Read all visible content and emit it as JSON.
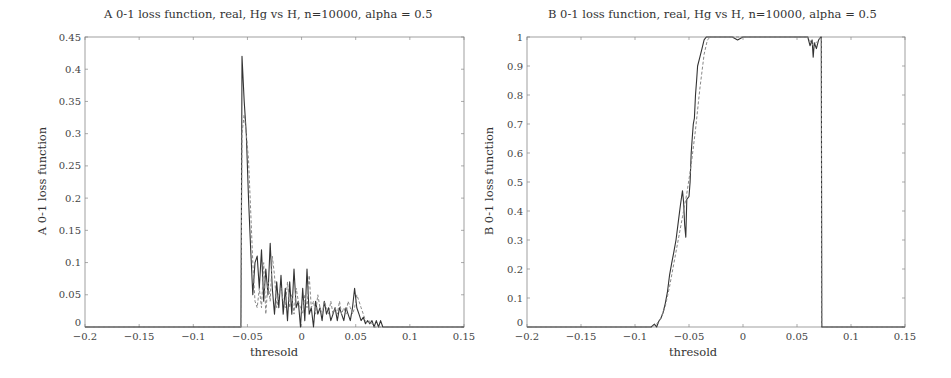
{
  "chart_data": [
    {
      "id": "A",
      "type": "line",
      "title": "A 0-1 loss function, real, Hg vs H, n=10000, alpha = 0.5",
      "xlabel": "thresold",
      "ylabel": "A 0-1 loss function",
      "xlim": [
        -0.2,
        0.15
      ],
      "ylim": [
        0,
        0.45
      ],
      "xticks": [
        "−0.2",
        "−0.15",
        "−0.1",
        "−0.05",
        "0",
        "0.05",
        "0.1",
        "0.15"
      ],
      "yticks": [
        "0",
        "0.05",
        "0.1",
        "0.15",
        "0.2",
        "0.25",
        "0.3",
        "0.35",
        "0.4",
        "0.45"
      ],
      "grid": false,
      "legend": null,
      "series": [
        {
          "name": "solid",
          "style": "solid",
          "x": [
            -0.2,
            -0.056,
            -0.0555,
            -0.055,
            -0.053,
            -0.051,
            -0.049,
            -0.047,
            -0.045,
            -0.043,
            -0.041,
            -0.039,
            -0.037,
            -0.035,
            -0.033,
            -0.031,
            -0.029,
            -0.027,
            -0.025,
            -0.023,
            -0.021,
            -0.019,
            -0.017,
            -0.015,
            -0.013,
            -0.011,
            -0.009,
            -0.007,
            -0.005,
            -0.003,
            -0.001,
            0.001,
            0.003,
            0.005,
            0.007,
            0.009,
            0.011,
            0.013,
            0.015,
            0.017,
            0.019,
            0.021,
            0.023,
            0.025,
            0.027,
            0.029,
            0.031,
            0.033,
            0.035,
            0.037,
            0.039,
            0.041,
            0.043,
            0.045,
            0.047,
            0.049,
            0.051,
            0.053,
            0.055,
            0.057,
            0.059,
            0.061,
            0.063,
            0.065,
            0.067,
            0.069,
            0.071,
            0.073,
            0.075,
            0.077,
            0.15
          ],
          "y": [
            0,
            0,
            0.2,
            0.42,
            0.35,
            0.3,
            0.2,
            0.12,
            0.05,
            0.1,
            0.11,
            0.06,
            0.12,
            0.04,
            0.09,
            0.05,
            0.13,
            0.06,
            0.02,
            0.07,
            0.03,
            0.08,
            0.02,
            0.06,
            0.01,
            0.07,
            0.02,
            0.09,
            0.03,
            0.04,
            0.0,
            0.06,
            0.01,
            0.09,
            0.02,
            0.03,
            0.0,
            0.04,
            0.02,
            0.03,
            0.01,
            0.04,
            0.02,
            0.03,
            0.01,
            0.02,
            0.03,
            0.01,
            0.03,
            0.02,
            0.01,
            0.03,
            0.02,
            0.01,
            0.03,
            0.06,
            0.03,
            0.02,
            0.01,
            0.015,
            0.005,
            0.01,
            0.005,
            0.01,
            0.0,
            0.01,
            0.0,
            0.01,
            0.0,
            0.0,
            0.0
          ]
        },
        {
          "name": "dashed",
          "style": "dashed",
          "x": [
            -0.2,
            -0.056,
            -0.055,
            -0.053,
            -0.051,
            -0.049,
            -0.047,
            -0.045,
            -0.043,
            -0.041,
            -0.039,
            -0.037,
            -0.035,
            -0.033,
            -0.031,
            -0.029,
            -0.027,
            -0.025,
            -0.023,
            -0.021,
            -0.019,
            -0.017,
            -0.015,
            -0.013,
            -0.011,
            -0.009,
            -0.007,
            -0.005,
            -0.003,
            -0.001,
            0.001,
            0.003,
            0.005,
            0.007,
            0.009,
            0.011,
            0.013,
            0.015,
            0.017,
            0.019,
            0.021,
            0.023,
            0.025,
            0.027,
            0.029,
            0.031,
            0.033,
            0.035,
            0.037,
            0.039,
            0.041,
            0.043,
            0.045,
            0.047,
            0.049,
            0.051,
            0.053,
            0.055,
            0.057,
            0.059,
            0.061,
            0.063,
            0.065,
            0.067,
            0.069,
            0.071,
            0.15
          ],
          "y": [
            0,
            0,
            0.3,
            0.33,
            0.3,
            0.26,
            0.18,
            0.1,
            0.04,
            0.03,
            0.06,
            0.03,
            0.1,
            0.02,
            0.07,
            0.04,
            0.11,
            0.08,
            0.03,
            0.05,
            0.06,
            0.04,
            0.03,
            0.07,
            0.03,
            0.05,
            0.02,
            0.06,
            0.04,
            0.03,
            0.02,
            0.05,
            0.03,
            0.08,
            0.03,
            0.04,
            0.02,
            0.05,
            0.03,
            0.02,
            0.04,
            0.03,
            0.02,
            0.04,
            0.02,
            0.03,
            0.02,
            0.04,
            0.02,
            0.03,
            0.02,
            0.04,
            0.03,
            0.02,
            0.03,
            0.05,
            0.04,
            0.03,
            0.02,
            0.01,
            0.005,
            0.01,
            0.005,
            0.0,
            0.0,
            0.0,
            0.0
          ]
        }
      ]
    },
    {
      "id": "B",
      "type": "line",
      "title": "B 0-1 loss function, real, Hg vs H, n=10000, alpha = 0.5",
      "xlabel": "thresold",
      "ylabel": "B 0-1 loss function",
      "xlim": [
        -0.2,
        0.15
      ],
      "ylim": [
        0,
        1
      ],
      "xticks": [
        "−0.2",
        "−0.15",
        "−0.1",
        "−0.05",
        "0",
        "0.05",
        "0.1",
        "0.15"
      ],
      "yticks": [
        "0",
        "0.1",
        "0.2",
        "0.3",
        "0.4",
        "0.5",
        "0.6",
        "0.7",
        "0.8",
        "0.9",
        "1"
      ],
      "grid": false,
      "legend": null,
      "series": [
        {
          "name": "solid",
          "style": "solid",
          "x": [
            -0.2,
            -0.085,
            -0.082,
            -0.08,
            -0.078,
            -0.076,
            -0.074,
            -0.072,
            -0.07,
            -0.068,
            -0.066,
            -0.064,
            -0.062,
            -0.06,
            -0.058,
            -0.056,
            -0.055,
            -0.054,
            -0.053,
            -0.052,
            -0.05,
            -0.049,
            -0.048,
            -0.047,
            -0.046,
            -0.045,
            -0.044,
            -0.043,
            -0.042,
            -0.04,
            -0.038,
            -0.036,
            -0.034,
            -0.03,
            -0.02,
            -0.01,
            -0.005,
            0.0,
            0.02,
            0.04,
            0.06,
            0.062,
            0.064,
            0.065,
            0.066,
            0.068,
            0.07,
            0.072,
            0.0725,
            0.073,
            0.08,
            0.15
          ],
          "y": [
            0,
            0,
            0.01,
            0.0,
            0.02,
            0.03,
            0.05,
            0.08,
            0.12,
            0.18,
            0.22,
            0.26,
            0.3,
            0.36,
            0.42,
            0.47,
            0.43,
            0.35,
            0.31,
            0.44,
            0.45,
            0.5,
            0.6,
            0.65,
            0.7,
            0.72,
            0.8,
            0.85,
            0.9,
            0.93,
            0.96,
            0.99,
            1.0,
            1.0,
            1.0,
            1.0,
            0.99,
            1.0,
            1.0,
            1.0,
            1.0,
            0.97,
            0.99,
            0.93,
            0.98,
            0.96,
            0.99,
            1.0,
            1.0,
            0.0,
            0.0,
            0.0
          ]
        },
        {
          "name": "dashed",
          "style": "dashed",
          "x": [
            -0.2,
            -0.085,
            -0.08,
            -0.076,
            -0.072,
            -0.068,
            -0.064,
            -0.06,
            -0.056,
            -0.052,
            -0.048,
            -0.044,
            -0.04,
            -0.036,
            -0.033,
            -0.03,
            0.0,
            0.04,
            0.06,
            0.065,
            0.07,
            0.0725,
            0.073,
            0.15
          ],
          "y": [
            0,
            0,
            0.01,
            0.03,
            0.07,
            0.14,
            0.22,
            0.3,
            0.38,
            0.46,
            0.56,
            0.68,
            0.82,
            0.94,
            0.99,
            1.0,
            1.0,
            1.0,
            1.0,
            0.97,
            0.99,
            1.0,
            0.0,
            0.0
          ]
        }
      ]
    }
  ]
}
